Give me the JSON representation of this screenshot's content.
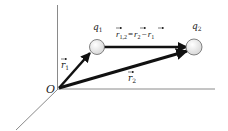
{
  "diagram": {
    "type": "vector-diagram",
    "origin_label": "O",
    "charges": [
      {
        "id": "q1",
        "label": "q",
        "subscript": "1",
        "cx": 97,
        "cy": 47,
        "r": 7.5
      },
      {
        "id": "q2",
        "label": "q",
        "subscript": "2",
        "cx": 194,
        "cy": 47,
        "r": 8
      }
    ],
    "vectors": [
      {
        "id": "r1",
        "label": "r",
        "subscript": "1",
        "from": "O",
        "to": "q1"
      },
      {
        "id": "r2",
        "label": "r",
        "subscript": "2",
        "from": "O",
        "to": "q2"
      },
      {
        "id": "r12",
        "label": "r",
        "subscript": "1,2",
        "from": "q1",
        "to": "q2"
      }
    ],
    "equation": {
      "lhs": "r",
      "lhs_sub": "1,2",
      "eq": "=",
      "term1": "r",
      "term1_sub": "2",
      "minus": "−",
      "term2": "r",
      "term2_sub": "1"
    },
    "axes": [
      "vertical",
      "horizontal",
      "diagonal"
    ],
    "colors": {
      "axis": "#888888",
      "vector": "#111111",
      "charge_fill": "#eeeeee",
      "charge_stroke": "#666666"
    }
  }
}
